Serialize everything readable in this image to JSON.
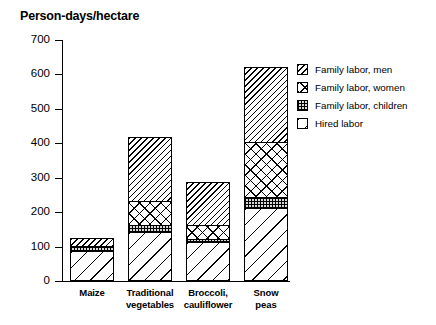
{
  "chart_data": {
    "type": "bar",
    "title": "Person-days/hectare",
    "xlabel": "",
    "ylabel": "",
    "ylim": [
      0,
      700
    ],
    "yticks": [
      0,
      100,
      200,
      300,
      400,
      500,
      600,
      700
    ],
    "grid": false,
    "stacked": true,
    "legend_position": "right",
    "categories": [
      "Maize",
      "Traditional vegetables",
      "Broccoli, cauliflower",
      "Snow peas"
    ],
    "category_lines": [
      [
        "Maize"
      ],
      [
        "Traditional",
        "vegetables"
      ],
      [
        "Broccoli,",
        "cauliflower"
      ],
      [
        "Snow",
        "peas"
      ]
    ],
    "series": [
      {
        "name": "Hired labor",
        "pattern": "sparse-diagonal",
        "values": [
          85,
          140,
          110,
          210
        ]
      },
      {
        "name": "Family labor, children",
        "pattern": "stipple",
        "values": [
          10,
          20,
          10,
          30
        ]
      },
      {
        "name": "Family labor, women",
        "pattern": "cross-hatch",
        "values": [
          5,
          70,
          40,
          160
        ]
      },
      {
        "name": "Family labor, men",
        "pattern": "dense-diagonal",
        "values": [
          22,
          185,
          125,
          220
        ]
      }
    ],
    "stack_order_bottom_to_top": [
      "Hired labor",
      "Family labor, children",
      "Family labor, women",
      "Family labor, men"
    ],
    "totals": [
      122,
      415,
      285,
      620
    ]
  },
  "legend": {
    "items": [
      {
        "label": "Family labor, men",
        "pattern": "dense-diagonal"
      },
      {
        "label": "Family labor, women",
        "pattern": "cross-hatch"
      },
      {
        "label": "Family labor, children",
        "pattern": "stipple"
      },
      {
        "label": "Hired labor",
        "pattern": "sparse-diagonal"
      }
    ]
  },
  "colors": {
    "ink": "#000000",
    "background": "#ffffff",
    "stipple_fill": "#d8d8d8"
  }
}
